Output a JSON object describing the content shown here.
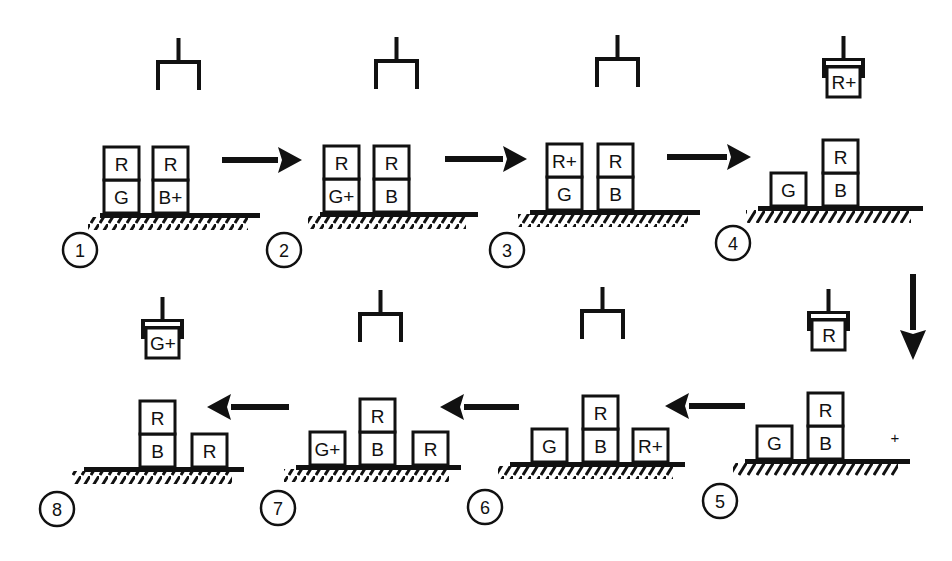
{
  "diagram": {
    "title": "",
    "colors": {
      "ink": "#111111",
      "background": "#ffffff"
    },
    "panels": [
      {
        "id": 1,
        "number": "1",
        "origin": [
          100,
          213
        ],
        "ground_width": 160,
        "gripper": {
          "x": 178,
          "state": "open",
          "holding": null
        },
        "stacks": [
          {
            "x": 104,
            "blocks": [
              "G",
              "R"
            ]
          },
          {
            "x": 153,
            "blocks": [
              "B+",
              "R"
            ]
          }
        ],
        "num_pos": [
          80,
          250
        ]
      },
      {
        "id": 2,
        "number": "2",
        "origin": [
          320,
          212
        ],
        "ground_width": 158,
        "gripper": {
          "x": 396,
          "state": "open",
          "holding": null
        },
        "stacks": [
          {
            "x": 324,
            "blocks": [
              "G+",
              "R"
            ]
          },
          {
            "x": 374,
            "blocks": [
              "B",
              "R"
            ]
          }
        ],
        "num_pos": [
          284,
          250
        ]
      },
      {
        "id": 3,
        "number": "3",
        "origin": [
          530,
          210
        ],
        "ground_width": 170,
        "gripper": {
          "x": 617,
          "state": "open",
          "holding": null
        },
        "stacks": [
          {
            "x": 547,
            "blocks": [
              "G",
              "R+"
            ]
          },
          {
            "x": 598,
            "blocks": [
              "B",
              "R"
            ]
          }
        ],
        "num_pos": [
          507,
          250
        ]
      },
      {
        "id": 4,
        "number": "4",
        "origin": [
          758,
          206
        ],
        "ground_width": 165,
        "gripper": {
          "x": 843,
          "state": "holding",
          "holding": "R+"
        },
        "stacks": [
          {
            "x": 771,
            "blocks": [
              "G"
            ]
          },
          {
            "x": 823,
            "blocks": [
              "B",
              "R"
            ]
          }
        ],
        "num_pos": [
          733,
          243
        ]
      },
      {
        "id": 5,
        "number": "5",
        "origin": [
          745,
          459
        ],
        "ground_width": 165,
        "gripper": {
          "x": 828,
          "state": "holding",
          "holding": "R"
        },
        "stacks": [
          {
            "x": 757,
            "blocks": [
              "G"
            ]
          },
          {
            "x": 808,
            "blocks": [
              "B",
              "R"
            ]
          }
        ],
        "marks": [
          {
            "text": "+",
            "x": 895,
            "y": 443
          }
        ],
        "num_pos": [
          720,
          501
        ]
      },
      {
        "id": 6,
        "number": "6",
        "origin": [
          510,
          462
        ],
        "ground_width": 175,
        "gripper": {
          "x": 602,
          "state": "open",
          "holding": null
        },
        "stacks": [
          {
            "x": 532,
            "blocks": [
              "G"
            ]
          },
          {
            "x": 583,
            "blocks": [
              "B",
              "R"
            ]
          },
          {
            "x": 633,
            "blocks": [
              "R+"
            ]
          }
        ],
        "num_pos": [
          485,
          507
        ]
      },
      {
        "id": 7,
        "number": "7",
        "origin": [
          296,
          465
        ],
        "ground_width": 165,
        "gripper": {
          "x": 380,
          "state": "open",
          "holding": null
        },
        "stacks": [
          {
            "x": 310,
            "blocks": [
              "G+"
            ]
          },
          {
            "x": 360,
            "blocks": [
              "B",
              "R"
            ]
          },
          {
            "x": 413,
            "blocks": [
              "R"
            ]
          }
        ],
        "num_pos": [
          278,
          508
        ]
      },
      {
        "id": 8,
        "number": "8",
        "origin": [
          84,
          467
        ],
        "ground_width": 160,
        "gripper": {
          "x": 162,
          "state": "holding",
          "holding": "G+"
        },
        "stacks": [
          {
            "x": 140,
            "blocks": [
              "B",
              "R"
            ]
          },
          {
            "x": 192,
            "blocks": [
              "R"
            ]
          }
        ],
        "num_pos": [
          57,
          509
        ]
      }
    ],
    "arrows": [
      {
        "from": "1",
        "to": "2",
        "direction": "right",
        "x1": 222,
        "y1": 160,
        "x2": 302,
        "y2": 160
      },
      {
        "from": "2",
        "to": "3",
        "direction": "right",
        "x1": 445,
        "y1": 159,
        "x2": 527,
        "y2": 159
      },
      {
        "from": "3",
        "to": "4",
        "direction": "right",
        "x1": 667,
        "y1": 157,
        "x2": 751,
        "y2": 157
      },
      {
        "from": "4",
        "to": "5",
        "direction": "down",
        "x1": 913,
        "y1": 274,
        "x2": 913,
        "y2": 360
      },
      {
        "from": "5",
        "to": "6",
        "direction": "left",
        "x1": 745,
        "y1": 406,
        "x2": 665,
        "y2": 406
      },
      {
        "from": "6",
        "to": "7",
        "direction": "left",
        "x1": 519,
        "y1": 407,
        "x2": 440,
        "y2": 407
      },
      {
        "from": "7",
        "to": "8",
        "direction": "left",
        "x1": 289,
        "y1": 407,
        "x2": 207,
        "y2": 407
      }
    ]
  }
}
